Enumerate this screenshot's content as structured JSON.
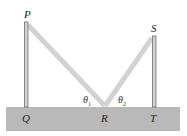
{
  "diagram": {
    "points": {
      "P": "P",
      "Q": "Q",
      "R": "R",
      "S": "S",
      "T": "T"
    },
    "angles": {
      "theta1": "θ",
      "theta1_sub": "1",
      "theta2": "θ",
      "theta2_sub": "2"
    },
    "colors": {
      "ground": "#b9b9b9",
      "rope": "#d2d2d2",
      "pole": "#c8c8c8",
      "pole_edge": "#6f6f6f"
    }
  }
}
